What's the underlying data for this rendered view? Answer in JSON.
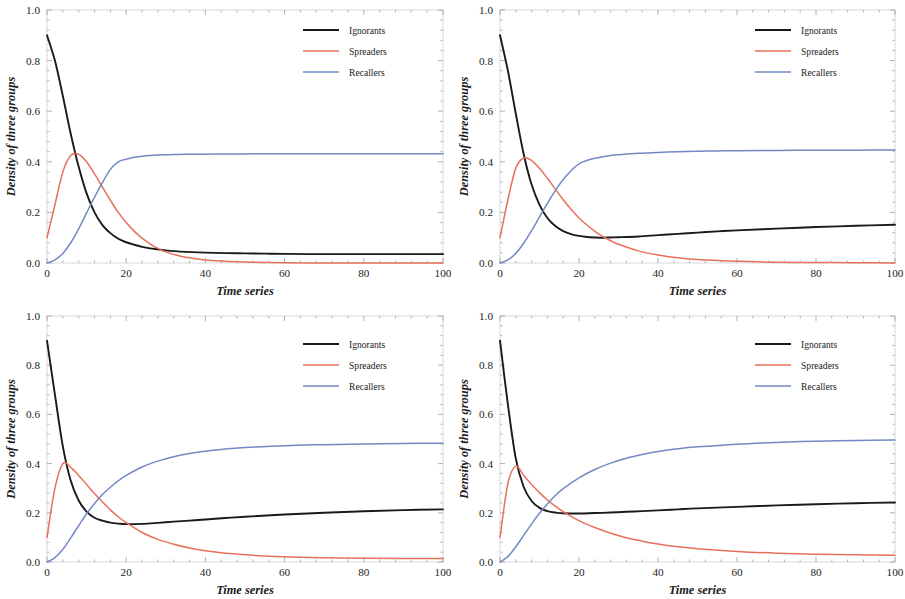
{
  "figure": {
    "panel_count": 4,
    "background_color": "#ffffff",
    "frame_color": "#cfcfd6",
    "tick_color": "#9a9aa6"
  },
  "series_styles": [
    {
      "key": "ignorants",
      "label": "Ignorants",
      "color": "#1a1a1a",
      "width": 1.9
    },
    {
      "key": "spreaders",
      "label": "Spreaders",
      "color": "#e8705a",
      "width": 1.5
    },
    {
      "key": "recallers",
      "label": "Recallers",
      "color": "#7289c4",
      "width": 1.5
    }
  ],
  "axes_common": {
    "xlabel": "Time series",
    "ylabel": "Density of three groups",
    "xlim": [
      0,
      100
    ],
    "ylim": [
      0.0,
      1.0
    ],
    "xticks": [
      0,
      20,
      40,
      60,
      80,
      100
    ],
    "xtick_labels": [
      "0",
      "20",
      "40",
      "60",
      "80",
      "100"
    ],
    "yticks": [
      0.0,
      0.2,
      0.4,
      0.6,
      0.8,
      1.0
    ],
    "ytick_labels": [
      "0.0",
      "0.2",
      "0.4",
      "0.6",
      "0.8",
      "1.0"
    ],
    "minor_ticks_per_interval": 4,
    "grid": false,
    "legend_position": "upper-right"
  },
  "chart_data": [
    {
      "id": "panel-1",
      "type": "line",
      "title": "",
      "xlabel": "Time series",
      "ylabel": "Density of three groups",
      "xlim": [
        0,
        100
      ],
      "ylim": [
        0.0,
        1.0
      ],
      "xticks": [
        0,
        20,
        40,
        60,
        80,
        100
      ],
      "yticks": [
        0.0,
        0.2,
        0.4,
        0.6,
        0.8,
        1.0
      ],
      "grid": false,
      "legend": [
        "Ignorants",
        "Spreaders",
        "Recallers"
      ],
      "legend_position": "upper-right",
      "x": [
        0,
        2,
        4,
        6,
        8,
        10,
        12,
        14,
        16,
        18,
        20,
        22,
        24,
        26,
        28,
        30,
        32,
        35,
        40,
        45,
        50,
        55,
        60,
        70,
        80,
        90,
        100
      ],
      "series": [
        {
          "name": "Ignorants",
          "color": "#1a1a1a",
          "values": [
            0.9,
            0.8,
            0.66,
            0.51,
            0.38,
            0.275,
            0.2,
            0.15,
            0.118,
            0.096,
            0.082,
            0.072,
            0.064,
            0.058,
            0.054,
            0.05,
            0.047,
            0.044,
            0.041,
            0.039,
            0.038,
            0.037,
            0.036,
            0.035,
            0.035,
            0.035,
            0.035
          ],
          "start": 0.9,
          "end": 0.035,
          "shape": "monotonic-decay"
        },
        {
          "name": "Spreaders",
          "color": "#e8705a",
          "values": [
            0.1,
            0.23,
            0.36,
            0.425,
            0.43,
            0.4,
            0.352,
            0.3,
            0.248,
            0.2,
            0.16,
            0.126,
            0.098,
            0.076,
            0.058,
            0.044,
            0.034,
            0.023,
            0.012,
            0.007,
            0.004,
            0.002,
            0.001,
            0.0,
            0.0,
            0.0,
            0.0
          ],
          "start": 0.1,
          "peak_value": 0.432,
          "peak_x": 7,
          "end": 0.0,
          "shape": "rise-peak-decay"
        },
        {
          "name": "Recallers",
          "color": "#7289c4",
          "values": [
            0.0,
            0.012,
            0.038,
            0.08,
            0.135,
            0.198,
            0.26,
            0.318,
            0.37,
            0.4,
            0.41,
            0.418,
            0.422,
            0.425,
            0.427,
            0.428,
            0.429,
            0.43,
            0.43,
            0.431,
            0.431,
            0.432,
            0.432,
            0.432,
            0.432,
            0.432,
            0.432
          ],
          "start": 0.0,
          "end": 0.432,
          "shape": "saturating-rise"
        }
      ]
    },
    {
      "id": "panel-2",
      "type": "line",
      "title": "",
      "xlabel": "Time series",
      "ylabel": "Density of three groups",
      "xlim": [
        0,
        100
      ],
      "ylim": [
        0.0,
        1.0
      ],
      "xticks": [
        0,
        20,
        40,
        60,
        80,
        100
      ],
      "yticks": [
        0.0,
        0.2,
        0.4,
        0.6,
        0.8,
        1.0
      ],
      "grid": false,
      "legend": [
        "Ignorants",
        "Spreaders",
        "Recallers"
      ],
      "legend_position": "upper-right",
      "x": [
        0,
        2,
        4,
        6,
        8,
        10,
        12,
        14,
        16,
        18,
        20,
        22,
        24,
        26,
        28,
        30,
        35,
        40,
        45,
        50,
        55,
        60,
        70,
        80,
        90,
        100
      ],
      "series": [
        {
          "name": "Ignorants",
          "color": "#1a1a1a",
          "values": [
            0.9,
            0.76,
            0.59,
            0.43,
            0.31,
            0.23,
            0.178,
            0.146,
            0.126,
            0.114,
            0.107,
            0.103,
            0.101,
            0.1,
            0.101,
            0.102,
            0.105,
            0.11,
            0.115,
            0.12,
            0.125,
            0.129,
            0.136,
            0.142,
            0.147,
            0.151
          ],
          "start": 0.9,
          "minimum": 0.1,
          "end": 0.151,
          "shape": "decay-then-slow-rise"
        },
        {
          "name": "Spreaders",
          "color": "#e8705a",
          "values": [
            0.1,
            0.25,
            0.375,
            0.415,
            0.405,
            0.375,
            0.335,
            0.292,
            0.25,
            0.212,
            0.178,
            0.15,
            0.125,
            0.105,
            0.088,
            0.074,
            0.048,
            0.032,
            0.021,
            0.014,
            0.01,
            0.007,
            0.003,
            0.002,
            0.001,
            0.0
          ],
          "start": 0.1,
          "peak_value": 0.418,
          "peak_x": 6,
          "end": 0.0,
          "shape": "rise-peak-decay"
        },
        {
          "name": "Recallers",
          "color": "#7289c4",
          "values": [
            0.0,
            0.012,
            0.038,
            0.078,
            0.128,
            0.182,
            0.236,
            0.286,
            0.33,
            0.365,
            0.392,
            0.405,
            0.414,
            0.42,
            0.425,
            0.428,
            0.434,
            0.437,
            0.44,
            0.442,
            0.443,
            0.444,
            0.445,
            0.446,
            0.446,
            0.447
          ],
          "start": 0.0,
          "end": 0.447,
          "shape": "saturating-rise"
        }
      ]
    },
    {
      "id": "panel-3",
      "type": "line",
      "title": "",
      "xlabel": "Time series",
      "ylabel": "Density of three groups",
      "xlim": [
        0,
        100
      ],
      "ylim": [
        0.0,
        1.0
      ],
      "xticks": [
        0,
        20,
        40,
        60,
        80,
        100
      ],
      "yticks": [
        0.0,
        0.2,
        0.4,
        0.6,
        0.8,
        1.0
      ],
      "grid": false,
      "legend": [
        "Ignorants",
        "Spreaders",
        "Recallers"
      ],
      "legend_position": "upper-right",
      "x": [
        0,
        2,
        4,
        6,
        8,
        10,
        12,
        14,
        16,
        18,
        20,
        24,
        28,
        32,
        36,
        40,
        45,
        50,
        60,
        70,
        80,
        90,
        100
      ],
      "series": [
        {
          "name": "Ignorants",
          "color": "#1a1a1a",
          "values": [
            0.9,
            0.68,
            0.47,
            0.33,
            0.25,
            0.205,
            0.18,
            0.168,
            0.16,
            0.156,
            0.154,
            0.155,
            0.159,
            0.164,
            0.168,
            0.173,
            0.179,
            0.184,
            0.193,
            0.2,
            0.206,
            0.211,
            0.214
          ],
          "start": 0.9,
          "minimum": 0.153,
          "end": 0.214,
          "shape": "decay-then-slow-rise"
        },
        {
          "name": "Spreaders",
          "color": "#e8705a",
          "values": [
            0.1,
            0.3,
            0.4,
            0.385,
            0.352,
            0.315,
            0.278,
            0.244,
            0.212,
            0.184,
            0.16,
            0.12,
            0.092,
            0.072,
            0.057,
            0.046,
            0.036,
            0.029,
            0.021,
            0.017,
            0.015,
            0.014,
            0.014
          ],
          "start": 0.1,
          "peak_value": 0.402,
          "peak_x": 4.5,
          "end": 0.014,
          "shape": "rise-peak-decay"
        },
        {
          "name": "Recallers",
          "color": "#7289c4",
          "values": [
            0.0,
            0.018,
            0.052,
            0.098,
            0.148,
            0.196,
            0.238,
            0.274,
            0.304,
            0.33,
            0.352,
            0.386,
            0.41,
            0.428,
            0.441,
            0.45,
            0.459,
            0.465,
            0.473,
            0.477,
            0.48,
            0.482,
            0.483
          ],
          "start": 0.0,
          "end": 0.483,
          "shape": "saturating-rise"
        }
      ]
    },
    {
      "id": "panel-4",
      "type": "line",
      "title": "",
      "xlabel": "Time series",
      "ylabel": "Density of three groups",
      "xlim": [
        0,
        100
      ],
      "ylim": [
        0.0,
        1.0
      ],
      "xticks": [
        0,
        20,
        40,
        60,
        80,
        100
      ],
      "yticks": [
        0.0,
        0.2,
        0.4,
        0.6,
        0.8,
        1.0
      ],
      "grid": false,
      "legend": [
        "Ignorants",
        "Spreaders",
        "Recallers"
      ],
      "legend_position": "upper-right",
      "x": [
        0,
        2,
        4,
        6,
        8,
        10,
        12,
        14,
        16,
        20,
        24,
        28,
        32,
        36,
        40,
        45,
        50,
        60,
        70,
        80,
        90,
        100
      ],
      "series": [
        {
          "name": "Ignorants",
          "color": "#1a1a1a",
          "values": [
            0.9,
            0.64,
            0.42,
            0.305,
            0.248,
            0.22,
            0.207,
            0.201,
            0.198,
            0.197,
            0.199,
            0.201,
            0.204,
            0.207,
            0.21,
            0.214,
            0.218,
            0.224,
            0.23,
            0.235,
            0.239,
            0.242
          ],
          "start": 0.9,
          "minimum": 0.197,
          "end": 0.242,
          "shape": "decay-then-slow-rise"
        },
        {
          "name": "Spreaders",
          "color": "#e8705a",
          "values": [
            0.1,
            0.32,
            0.39,
            0.352,
            0.315,
            0.282,
            0.252,
            0.227,
            0.205,
            0.168,
            0.14,
            0.117,
            0.099,
            0.085,
            0.073,
            0.062,
            0.054,
            0.043,
            0.036,
            0.032,
            0.029,
            0.027
          ],
          "start": 0.1,
          "peak_value": 0.392,
          "peak_x": 4,
          "end": 0.027,
          "shape": "rise-peak-decay"
        },
        {
          "name": "Recallers",
          "color": "#7289c4",
          "values": [
            0.0,
            0.022,
            0.062,
            0.108,
            0.155,
            0.198,
            0.236,
            0.27,
            0.298,
            0.342,
            0.376,
            0.402,
            0.422,
            0.437,
            0.449,
            0.46,
            0.468,
            0.479,
            0.486,
            0.491,
            0.494,
            0.496
          ],
          "start": 0.0,
          "end": 0.496,
          "shape": "saturating-rise"
        }
      ]
    }
  ]
}
